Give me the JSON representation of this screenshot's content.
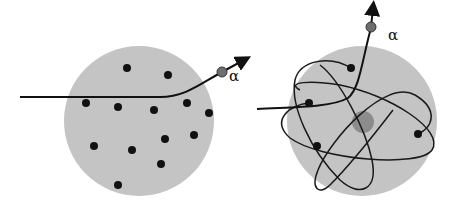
{
  "figure": {
    "width": 456,
    "height": 211,
    "background": "#ffffff",
    "panels": [
      {
        "id": "plum-pudding-model",
        "sphere": {
          "cx": 139,
          "cy": 121,
          "r": 75,
          "color": "#c4c4c4"
        },
        "charges": [
          {
            "x": 127,
            "y": 68
          },
          {
            "x": 168,
            "y": 75
          },
          {
            "x": 86,
            "y": 103
          },
          {
            "x": 118,
            "y": 107
          },
          {
            "x": 154,
            "y": 110
          },
          {
            "x": 187,
            "y": 103
          },
          {
            "x": 209,
            "y": 113
          },
          {
            "x": 165,
            "y": 139
          },
          {
            "x": 194,
            "y": 135
          },
          {
            "x": 94,
            "y": 146
          },
          {
            "x": 132,
            "y": 150
          },
          {
            "x": 161,
            "y": 164
          },
          {
            "x": 118,
            "y": 185
          }
        ],
        "charge_radius": 4,
        "charge_color": "#111111",
        "trajectory": "M20,97 L160,97 C185,97 200,84 222,72",
        "alpha_particle": {
          "x": 222,
          "y": 72,
          "r": 5,
          "color": "#6e6e6e"
        },
        "arrow_tip": {
          "x": 244,
          "y": 60
        },
        "alpha_label": {
          "text": "α",
          "x": 229,
          "y": 81
        }
      },
      {
        "id": "nuclear-model",
        "sphere": {
          "cx": 362,
          "cy": 121,
          "r": 75,
          "color": "#c4c4c4"
        },
        "nucleus": {
          "cx": 363,
          "cy": 122,
          "r": 11,
          "color": "#8c8c8c"
        },
        "orbits": [
          "M351,68 C330,55 300,60 295,80 C290,105 310,150 340,180 C360,198 378,190 372,160 C366,130 340,80 320,65",
          "M309,103 C290,105 270,120 290,138 C320,160 420,168 432,150 C445,130 390,95 340,85 C310,80 285,82 300,90",
          "M418,134 C432,128 440,110 415,95 C385,78 330,140 318,170 C310,190 320,195 330,185 C345,170 370,140 393,110"
        ],
        "electrons": [
          {
            "x": 351,
            "y": 68
          },
          {
            "x": 309,
            "y": 103
          },
          {
            "x": 418,
            "y": 134
          },
          {
            "x": 317,
            "y": 146
          }
        ],
        "electron_radius": 4,
        "electron_color": "#111111",
        "trajectory": "M257,109 C290,107 330,108 348,98 C360,88 362,60 371,28",
        "alpha_particle": {
          "x": 371,
          "y": 27,
          "r": 5,
          "color": "#6e6e6e"
        },
        "arrow_tip": {
          "x": 373,
          "y": 8
        },
        "alpha_label": {
          "text": "α",
          "x": 388,
          "y": 40
        }
      }
    ]
  }
}
